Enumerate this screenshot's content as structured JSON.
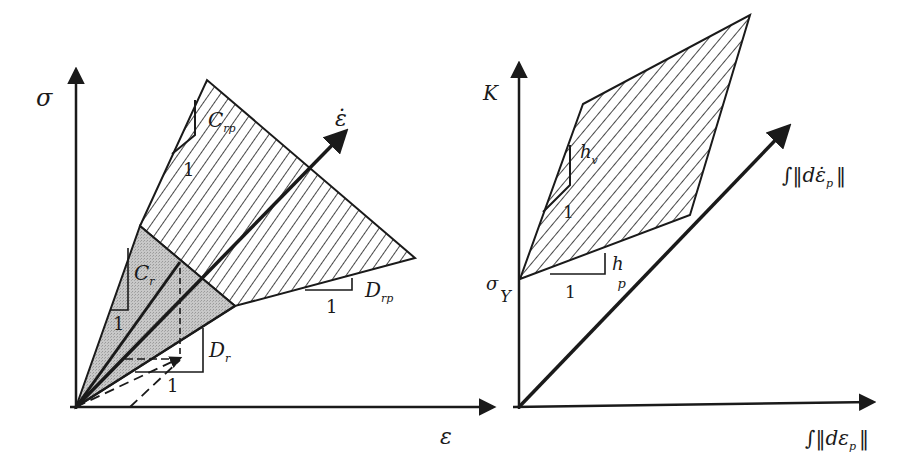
{
  "figure": {
    "left_panel": {
      "y_axis_label": "σ",
      "x_axis_label": "ε",
      "rate_axis_label": "ε̇",
      "labels": {
        "C_rp": "C",
        "C_rp_sub": "rp",
        "C_r": "C",
        "C_r_sub": "r",
        "D_rp": "D",
        "D_rp_sub": "rp",
        "D_r": "D",
        "D_r_sub": "r",
        "unit_1": "1",
        "unit_2": "1",
        "unit_3": "1",
        "unit_4": "1"
      },
      "regions": {
        "hatched": "rate-dependent plastic region",
        "shaded": "rate-dependent elastic region"
      }
    },
    "right_panel": {
      "y_axis_label": "K",
      "x_axis_label": "∫‖dε",
      "x_axis_label_sub": "p",
      "x_axis_label_end": "‖",
      "rate_axis_label": "∫‖dε̇",
      "rate_axis_label_sub": "p",
      "rate_axis_label_end": "‖",
      "labels": {
        "sigma_Y": "σ",
        "sigma_Y_sub": "Y",
        "h_v": "h",
        "h_v_sub": "v",
        "h_p": "h",
        "h_p_sub": "p",
        "unit_1": "1",
        "unit_2": "1"
      }
    },
    "colors": {
      "line": "#1a1a1a",
      "shade": "#b8b8b8",
      "background": "#ffffff"
    }
  }
}
